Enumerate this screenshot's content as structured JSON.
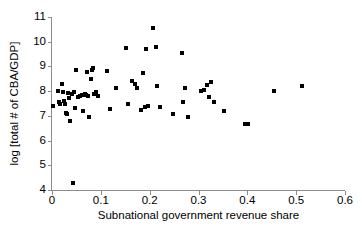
{
  "chart_data": {
    "type": "scatter",
    "title": "",
    "xlabel": "Subnational government revenue share",
    "ylabel": "log [total # of CBA/GDP]",
    "xlim": [
      0,
      0.6
    ],
    "ylim": [
      4,
      11
    ],
    "xticks": [
      0,
      0.1,
      0.2,
      0.3,
      0.4,
      0.5,
      0.6
    ],
    "xtick_labels": [
      "0",
      "0.1",
      "0.2",
      "0.3",
      "0.4",
      "0.5",
      "0.6"
    ],
    "yticks": [
      4,
      5,
      6,
      7,
      8,
      9,
      10,
      11
    ],
    "ytick_labels": [
      "4",
      "5",
      "6",
      "7",
      "8",
      "9",
      "10",
      "11"
    ],
    "grid": false,
    "legend": null,
    "marker": "square",
    "marker_color": "#000000",
    "axis_color": "#8c8c8c",
    "series": [
      {
        "name": "countries",
        "points": [
          [
            0.002,
            7.38
          ],
          [
            0.012,
            8.02
          ],
          [
            0.014,
            7.58
          ],
          [
            0.016,
            7.5
          ],
          [
            0.02,
            8.3
          ],
          [
            0.022,
            7.98
          ],
          [
            0.024,
            7.62
          ],
          [
            0.026,
            7.46
          ],
          [
            0.028,
            7.1
          ],
          [
            0.03,
            7.08
          ],
          [
            0.032,
            7.92
          ],
          [
            0.034,
            7.72
          ],
          [
            0.036,
            6.78
          ],
          [
            0.04,
            7.88
          ],
          [
            0.042,
            4.3
          ],
          [
            0.046,
            7.96
          ],
          [
            0.048,
            7.3
          ],
          [
            0.05,
            8.84
          ],
          [
            0.054,
            7.76
          ],
          [
            0.058,
            7.8
          ],
          [
            0.062,
            7.84
          ],
          [
            0.064,
            7.18
          ],
          [
            0.068,
            7.88
          ],
          [
            0.07,
            7.84
          ],
          [
            0.072,
            8.78
          ],
          [
            0.074,
            7.8
          ],
          [
            0.076,
            6.94
          ],
          [
            0.08,
            8.5
          ],
          [
            0.082,
            8.86
          ],
          [
            0.084,
            8.94
          ],
          [
            0.086,
            7.88
          ],
          [
            0.09,
            7.96
          ],
          [
            0.094,
            7.82
          ],
          [
            0.112,
            8.8
          ],
          [
            0.118,
            7.28
          ],
          [
            0.132,
            8.12
          ],
          [
            0.152,
            9.74
          ],
          [
            0.156,
            7.46
          ],
          [
            0.164,
            8.42
          ],
          [
            0.17,
            8.28
          ],
          [
            0.174,
            8.14
          ],
          [
            0.182,
            7.22
          ],
          [
            0.186,
            8.72
          ],
          [
            0.19,
            7.34
          ],
          [
            0.192,
            9.72
          ],
          [
            0.196,
            7.38
          ],
          [
            0.206,
            10.54
          ],
          [
            0.212,
            9.78
          ],
          [
            0.216,
            8.22
          ],
          [
            0.222,
            7.34
          ],
          [
            0.248,
            7.06
          ],
          [
            0.266,
            9.54
          ],
          [
            0.268,
            7.58
          ],
          [
            0.272,
            8.12
          ],
          [
            0.278,
            6.94
          ],
          [
            0.306,
            8.02
          ],
          [
            0.312,
            8.06
          ],
          [
            0.318,
            8.26
          ],
          [
            0.322,
            7.78
          ],
          [
            0.326,
            8.38
          ],
          [
            0.332,
            7.56
          ],
          [
            0.352,
            7.18
          ],
          [
            0.396,
            6.66
          ],
          [
            0.402,
            6.68
          ],
          [
            0.454,
            8.0
          ],
          [
            0.512,
            8.22
          ]
        ]
      }
    ]
  }
}
